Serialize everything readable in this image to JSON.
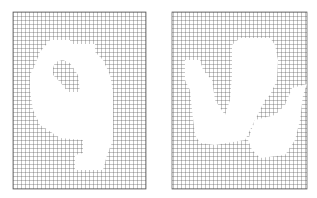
{
  "figure": {
    "panels": [
      {
        "id": "left",
        "description": "pixel-grid shape resembling the digit 9",
        "grid": {
          "x": 13,
          "y": 12,
          "width": 133,
          "height": 177,
          "cell": 4
        },
        "shape_outer": "50,40 70,40 70,44 95,44 95,52 103,60 110,75 113,92 113,140 107,155 103,170 75,170 75,155 83,153 83,140 60,138 48,130 40,125 33,110 30,90 30,75 35,65 40,52",
        "shape_hole": "55,62 63,60 70,63 78,75 80,92 68,92 60,82 53,75 53,68"
      },
      {
        "id": "right",
        "description": "pixel-grid shape resembling a U with a detached right stroke",
        "grid": {
          "x": 172,
          "y": 12,
          "width": 135,
          "height": 177,
          "cell": 4
        },
        "shape_outer": "185,60 200,60 203,70 212,80 215,100 225,115 230,100 232,75 232,45 240,38 270,38 275,45 278,60 277,80 270,95 265,100 260,110 255,120 250,130 245,140 215,145 200,143 195,135 192,110 190,90 185,80",
        "shape_second": "255,120 275,115 285,105 292,88 307,84 303,95 300,120 295,140 285,155 260,158 252,150 248,140"
      }
    ],
    "colors": {
      "grid_line": "#555555",
      "background": "#ffffff",
      "fill": "#ffffff"
    }
  }
}
